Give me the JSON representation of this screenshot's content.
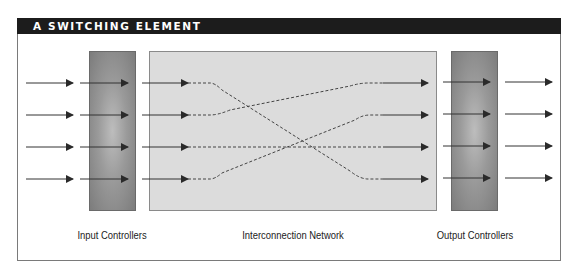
{
  "header": {
    "title": "A SWITCHING ELEMENT",
    "background": "#1c1c1c"
  },
  "diagram": {
    "input_controllers": {
      "label": "Input Controllers",
      "fill": "#9a9a9a"
    },
    "interconnection_network": {
      "label": "Interconnection Network",
      "fill": "#dcdcdc"
    },
    "output_controllers": {
      "label": "Output Controllers",
      "fill": "#9a9a9a"
    },
    "lines": 4,
    "connections": [
      {
        "from_input": 1,
        "to_output": 4
      },
      {
        "from_input": 2,
        "to_output": 1
      },
      {
        "from_input": 3,
        "to_output": 3
      },
      {
        "from_input": 4,
        "to_output": 2
      }
    ],
    "arrow_icon": "arrow-right-icon"
  }
}
